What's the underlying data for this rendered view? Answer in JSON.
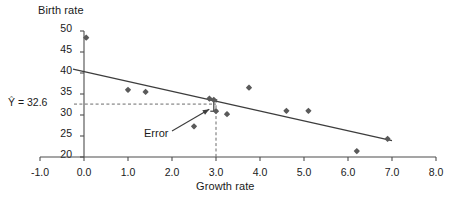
{
  "chart_data": {
    "type": "scatter",
    "title": "",
    "xlabel": "Growth rate",
    "ylabel": "Birth rate",
    "xlim": [
      -1.0,
      8.0
    ],
    "ylim": [
      20,
      50
    ],
    "grid": false,
    "legend": "none",
    "xticks": [
      "-1.0",
      "0.0",
      "1.0",
      "2.0",
      "3.0",
      "4.0",
      "5.0",
      "6.0",
      "7.0",
      "8.0"
    ],
    "xtick_values": [
      -1.0,
      0.0,
      1.0,
      2.0,
      3.0,
      4.0,
      5.0,
      6.0,
      7.0,
      8.0
    ],
    "yticks": [
      "20",
      "25",
      "30",
      "35",
      "40",
      "45",
      "50"
    ],
    "ytick_values": [
      20,
      25,
      30,
      35,
      40,
      45,
      50
    ],
    "points": [
      {
        "x": 0.05,
        "y": 48.4
      },
      {
        "x": 1.0,
        "y": 36.0
      },
      {
        "x": 1.4,
        "y": 35.5
      },
      {
        "x": 2.5,
        "y": 27.3
      },
      {
        "x": 2.85,
        "y": 33.9
      },
      {
        "x": 2.95,
        "y": 33.6
      },
      {
        "x": 3.0,
        "y": 30.9
      },
      {
        "x": 3.25,
        "y": 30.2
      },
      {
        "x": 3.75,
        "y": 36.5
      },
      {
        "x": 4.6,
        "y": 31.0
      },
      {
        "x": 5.1,
        "y": 31.0
      },
      {
        "x": 6.2,
        "y": 21.4
      },
      {
        "x": 6.9,
        "y": 24.3
      }
    ],
    "fit_line": {
      "label": "regression-line",
      "x0": -0.25,
      "y0": 40.9,
      "x1": 7.0,
      "y1": 23.9
    },
    "annotations": [
      {
        "name": "predicted-value",
        "text": "Ŷ = 32.6",
        "value": 32.6
      },
      {
        "name": "error-annotation",
        "text": "Error"
      }
    ],
    "reference_lines": [
      {
        "name": "yhat-horizontal-dashed",
        "orientation": "horizontal",
        "value": 32.6,
        "style": "dashed"
      },
      {
        "name": "x-vertical-dashed",
        "orientation": "vertical",
        "value": 3.0,
        "style": "dashed"
      }
    ],
    "error_segment": {
      "x": 2.95,
      "y_top": 33.6,
      "y_bottom": 30.9
    },
    "colors": {
      "marker": "#5a5a5a",
      "line": "#3d3d3d",
      "axis": "#4d4d4d",
      "dashed": "#6b6b6b",
      "text": "#1a1a1a",
      "background": "#ffffff"
    }
  },
  "axes": {
    "ylabel": "Birth rate",
    "xlabel": "Growth rate",
    "yticks": [
      "50",
      "45",
      "40",
      "35",
      "30",
      "25",
      "20"
    ],
    "xticks": [
      "-1.0",
      "0.0",
      "1.0",
      "2.0",
      "3.0",
      "4.0",
      "5.0",
      "6.0",
      "7.0",
      "8.0"
    ]
  },
  "labels": {
    "yhat": "Ŷ = 32.6",
    "error": "Error"
  }
}
